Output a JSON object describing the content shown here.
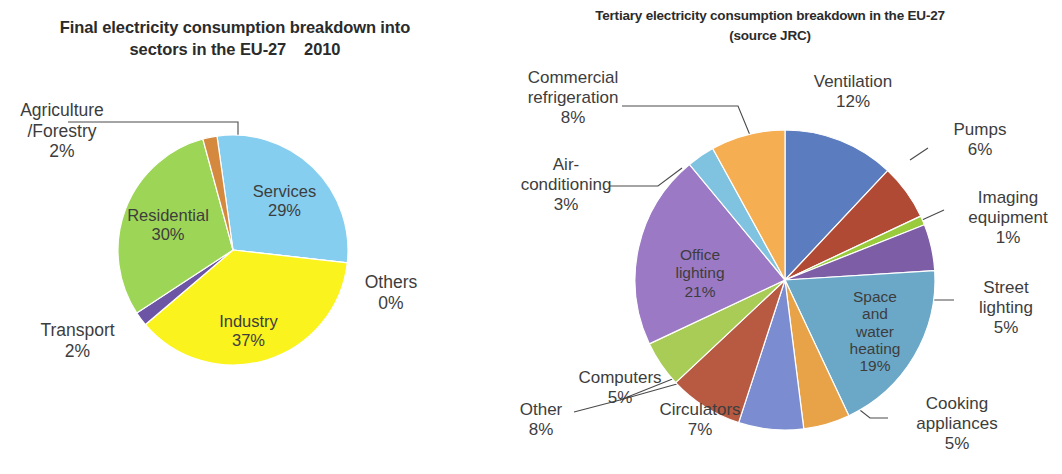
{
  "charts": {
    "left": {
      "title": "Final electricity consumption breakdown into\nsectors in the EU-27    2010",
      "center": [
        233,
        250
      ],
      "radius": 115,
      "start_angle": -8
    },
    "right": {
      "title": "Tertiary electricity consumption breakdown in the EU-27\n(source JRC)",
      "center": [
        315,
        280
      ],
      "radius": 150,
      "start_angle": 0
    }
  },
  "chart_data": [
    {
      "type": "pie",
      "title": "Final electricity consumption breakdown into sectors in the EU-27    2010",
      "title_line1": "Final electricity consumption breakdown into",
      "title_line2": "sectors in the EU-27    2010",
      "legend": "labels-on-slices",
      "categories": [
        "Services",
        "Others",
        "Industry",
        "Transport",
        "Residential",
        "Agriculture/Forestry"
      ],
      "values": [
        29,
        0,
        37,
        2,
        30,
        2
      ],
      "labels": [
        "29%",
        "0%",
        "37%",
        "2%",
        "30%",
        "2%"
      ],
      "colors": [
        "#86CEEF",
        "#555555",
        "#FAF31D",
        "#6B54A3",
        "#9BD martial",
        "#D98A3C"
      ],
      "slices": [
        {
          "name": "Services",
          "value": 29,
          "pct": "29%",
          "color": "#86CEEF",
          "label_pos": "inside"
        },
        {
          "name": "Others",
          "value": 0,
          "pct": "0%",
          "color": "#5E5E5E",
          "label_pos": "outside"
        },
        {
          "name": "Industry",
          "value": 37,
          "pct": "37%",
          "color": "#FAF31D",
          "label_pos": "inside"
        },
        {
          "name": "Transport",
          "value": 2,
          "pct": "2%",
          "color": "#6B55A4",
          "label_pos": "outside"
        },
        {
          "name": "Residential",
          "value": 30,
          "pct": "30%",
          "color": "#9DD557",
          "label_pos": "inside"
        },
        {
          "name": "Agriculture/Forestry",
          "value": 2,
          "pct": "2%",
          "color": "#D4893E",
          "label_pos": "outside"
        }
      ]
    },
    {
      "type": "pie",
      "title": "Tertiary electricity consumption breakdown in the EU-27 (source JRC)",
      "title_line1": "Tertiary electricity consumption breakdown in the EU-27",
      "title_line2": "(source JRC)",
      "legend": "labels-on-slices",
      "categories": [
        "Ventilation",
        "Pumps",
        "Imaging equipment",
        "Street lighting",
        "Space and water heating",
        "Cooking appliances",
        "Circulators",
        "Other",
        "Computers",
        "Office lighting",
        "Air-conditioning",
        "Commercial refrigeration"
      ],
      "values": [
        12,
        6,
        1,
        5,
        19,
        5,
        7,
        8,
        5,
        21,
        3,
        8
      ],
      "labels": [
        "12%",
        "6%",
        "1%",
        "5%",
        "19%",
        "5%",
        "7%",
        "8%",
        "5%",
        "21%",
        "3%",
        "8%"
      ],
      "slices": [
        {
          "name": "Ventilation",
          "value": 12,
          "pct": "12%",
          "color": "#5B7CBE",
          "label_pos": "outside"
        },
        {
          "name": "Pumps",
          "value": 6,
          "pct": "6%",
          "color": "#B14A35",
          "label_pos": "outside"
        },
        {
          "name": "Imaging equipment",
          "value": 1,
          "pct": "1%",
          "color": "#9ACB3C",
          "label_pos": "outside"
        },
        {
          "name": "Street lighting",
          "value": 5,
          "pct": "5%",
          "color": "#7D5EA6",
          "label_pos": "outside"
        },
        {
          "name": "Space and water heating",
          "value": 19,
          "pct": "19%",
          "color": "#6BA8C8",
          "label_pos": "inside"
        },
        {
          "name": "Cooking appliances",
          "value": 5,
          "pct": "5%",
          "color": "#E8A248",
          "label_pos": "outside"
        },
        {
          "name": "Circulators",
          "value": 7,
          "pct": "7%",
          "color": "#7B8DD0",
          "label_pos": "outside"
        },
        {
          "name": "Other",
          "value": 8,
          "pct": "8%",
          "color": "#B85A42",
          "label_pos": "outside"
        },
        {
          "name": "Computers",
          "value": 5,
          "pct": "5%",
          "color": "#A8CC55",
          "label_pos": "outside"
        },
        {
          "name": "Office lighting",
          "value": 21,
          "pct": "21%",
          "color": "#9B79C4",
          "label_pos": "inside"
        },
        {
          "name": "Air-conditioning",
          "value": 3,
          "pct": "3%",
          "color": "#7FC3E0",
          "label_pos": "outside"
        },
        {
          "name": "Commercial refrigeration",
          "value": 8,
          "pct": "8%",
          "color": "#F5AE52",
          "label_pos": "outside"
        }
      ]
    }
  ],
  "left_labels": [
    {
      "key": "agriculture",
      "name": "Agriculture\n/Forestry",
      "pct": "2%",
      "x": 2,
      "y": 100,
      "w": 120,
      "place": "outside"
    },
    {
      "key": "residential",
      "name": "Residential",
      "pct": "30%",
      "x": 108,
      "y": 206,
      "w": 120,
      "place": "inside"
    },
    {
      "key": "services",
      "name": "Services",
      "pct": "29%",
      "x": 232,
      "y": 182,
      "w": 105,
      "place": "inside"
    },
    {
      "key": "others",
      "name": "Others",
      "pct": "0%",
      "x": 346,
      "y": 272,
      "w": 90,
      "place": "outside"
    },
    {
      "key": "industry",
      "name": "Industry",
      "pct": "37%",
      "x": 196,
      "y": 312,
      "w": 105,
      "place": "inside"
    },
    {
      "key": "transport",
      "name": "Transport",
      "pct": "2%",
      "x": 20,
      "y": 320,
      "w": 115,
      "place": "outside"
    }
  ],
  "right_labels": [
    {
      "key": "commercial-refrigeration",
      "name": "Commercial\nrefrigeration",
      "pct": "8%",
      "x": 28,
      "y": 68,
      "w": 150,
      "place": "outside"
    },
    {
      "key": "air-conditioning",
      "name": "Air-\nconditioning",
      "pct": "3%",
      "x": 26,
      "y": 155,
      "w": 140,
      "place": "outside"
    },
    {
      "key": "ventilation",
      "name": "Ventilation",
      "pct": "12%",
      "x": 318,
      "y": 72,
      "w": 130,
      "place": "outside"
    },
    {
      "key": "pumps",
      "name": "Pumps",
      "pct": "6%",
      "x": 460,
      "y": 120,
      "w": 100,
      "place": "outside"
    },
    {
      "key": "imaging-equipment",
      "name": "Imaging\nequipment",
      "pct": "1%",
      "x": 478,
      "y": 188,
      "w": 120,
      "place": "outside"
    },
    {
      "key": "street-lighting",
      "name": "Street\nlighting",
      "pct": "5%",
      "x": 486,
      "y": 278,
      "w": 100,
      "place": "outside"
    },
    {
      "key": "office-lighting",
      "name": "Office\nlighting",
      "pct": "21%",
      "x": 182,
      "y": 246,
      "w": 96,
      "place": "inside"
    },
    {
      "key": "space-water-heating",
      "name": "Space\nand\nwater\nheating",
      "pct": "19%",
      "x": 362,
      "y": 288,
      "w": 86,
      "place": "inside"
    },
    {
      "key": "computers",
      "name": "Computers",
      "pct": "5%",
      "x": 88,
      "y": 368,
      "w": 124,
      "place": "outside"
    },
    {
      "key": "other",
      "name": "Other",
      "pct": "8%",
      "x": 30,
      "y": 400,
      "w": 82,
      "place": "outside"
    },
    {
      "key": "circulators",
      "name": "Circulators",
      "pct": "7%",
      "x": 168,
      "y": 400,
      "w": 124,
      "place": "outside"
    },
    {
      "key": "cooking-appliances",
      "name": "Cooking\nappliances",
      "pct": "5%",
      "x": 420,
      "y": 394,
      "w": 134,
      "place": "outside"
    }
  ]
}
